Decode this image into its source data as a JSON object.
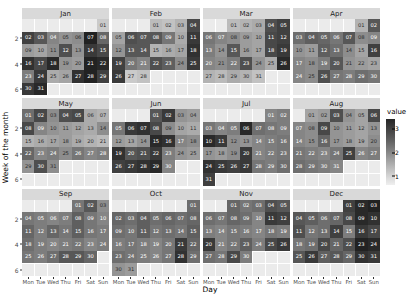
{
  "chart_data": {
    "type": "heatmap",
    "title": "",
    "xlabel": "Day",
    "ylabel": "Week of the month",
    "legend_title": "value",
    "legend_position": "right",
    "legend_ticks": [
      1,
      2,
      3
    ],
    "value_range": [
      0.6,
      3.4
    ],
    "color_low": "#f0f0f0",
    "color_high": "#1a1a1a",
    "panel_bg": "#ebebeb",
    "strip_bg": "#d9d9d9",
    "grid_color": "#ffffff",
    "x_categories": [
      "Mon",
      "Tue",
      "Wed",
      "Thu",
      "Fri",
      "Sat",
      "Sun"
    ],
    "y_ticks": [
      2,
      4,
      6
    ],
    "y_range": [
      1,
      6
    ],
    "facet_variable": "month",
    "facets": [
      {
        "label": "Jan",
        "start_weekday": 6,
        "days": 31,
        "values": [
          1.1,
          2.9,
          2.6,
          2.0,
          1.8,
          1.9,
          3.3,
          2.4,
          1.7,
          1.6,
          1.9,
          2.7,
          1.8,
          3.0,
          2.8,
          3.1,
          2.8,
          3.2,
          1.8,
          1.7,
          3.3,
          3.2,
          2.1,
          3.0,
          1.5,
          1.6,
          3.1,
          3.3,
          2.9,
          3.0,
          3.2
        ]
      },
      {
        "label": "Feb",
        "start_weekday": 3,
        "days": 28,
        "values": [
          1.3,
          1.2,
          1.4,
          2.8,
          1.6,
          2.7,
          2.6,
          2.6,
          2.2,
          1.5,
          3.0,
          1.8,
          2.6,
          2.6,
          1.4,
          1.5,
          1.6,
          3.1,
          2.9,
          2.2,
          2.0,
          2.7,
          2.5,
          1.9,
          3.0,
          3.0,
          1.1,
          1.2
        ]
      },
      {
        "label": "Mar",
        "start_weekday": 2,
        "days": 31,
        "values": [
          1.3,
          1.4,
          1.5,
          2.7,
          2.9,
          2.2,
          2.0,
          1.9,
          1.7,
          1.6,
          2.8,
          2.9,
          2.1,
          1.8,
          2.6,
          1.7,
          1.6,
          2.8,
          3.0,
          2.0,
          1.9,
          2.1,
          2.7,
          1.8,
          1.5,
          3.2,
          1.4,
          1.3,
          1.5,
          1.4,
          1.2
        ]
      },
      {
        "label": "Apr",
        "start_weekday": 5,
        "days": 30,
        "values": [
          1.4,
          2.6,
          2.3,
          2.5,
          2.4,
          2.2,
          2.6,
          1.9,
          2.0,
          1.8,
          1.7,
          2.5,
          2.3,
          1.9,
          1.6,
          2.9,
          2.0,
          1.9,
          2.1,
          2.6,
          1.8,
          1.7,
          1.6,
          2.0,
          1.9,
          2.7,
          2.2,
          2.1,
          2.3,
          2.2
        ]
      },
      {
        "label": "May",
        "start_weekday": 0,
        "days": 31,
        "values": [
          2.3,
          2.8,
          1.9,
          2.7,
          2.8,
          1.5,
          1.4,
          2.8,
          2.0,
          1.8,
          1.7,
          1.6,
          1.5,
          1.9,
          1.4,
          1.5,
          1.6,
          1.7,
          1.5,
          1.4,
          1.3,
          2.4,
          2.0,
          2.1,
          1.9,
          2.2,
          2.0,
          2.1,
          1.8,
          2.7,
          1.9
        ]
      },
      {
        "label": "Jun",
        "start_weekday": 3,
        "days": 30,
        "values": [
          2.6,
          3.0,
          1.8,
          1.7,
          2.2,
          3.0,
          3.1,
          2.8,
          1.9,
          1.6,
          1.5,
          1.7,
          1.6,
          1.8,
          3.2,
          3.1,
          2.0,
          1.9,
          3.1,
          2.6,
          2.7,
          3.0,
          2.1,
          1.8,
          1.7,
          2.9,
          3.0,
          3.1,
          3.2,
          2.0
        ]
      },
      {
        "label": "Jul",
        "start_weekday": 5,
        "days": 31,
        "values": [
          2.0,
          2.1,
          2.2,
          2.0,
          2.1,
          3.2,
          2.3,
          2.2,
          2.1,
          3.2,
          3.0,
          1.9,
          1.8,
          2.0,
          2.1,
          2.2,
          1.8,
          1.7,
          1.9,
          3.0,
          2.0,
          2.1,
          2.2,
          3.1,
          3.0,
          2.9,
          3.0,
          2.2,
          2.1,
          2.3,
          2.9
        ]
      },
      {
        "label": "Aug",
        "start_weekday": 1,
        "days": 31,
        "values": [
          1.6,
          1.7,
          2.7,
          1.8,
          1.6,
          2.8,
          2.0,
          1.9,
          2.8,
          1.8,
          1.7,
          1.6,
          1.8,
          2.0,
          1.9,
          2.4,
          1.8,
          1.7,
          1.6,
          1.9,
          2.2,
          2.1,
          2.0,
          2.2,
          2.9,
          2.0,
          2.1,
          2.3,
          2.2,
          2.1,
          2.0
        ]
      },
      {
        "label": "Sep",
        "start_weekday": 4,
        "days": 30,
        "values": [
          2.2,
          2.6,
          1.9,
          2.2,
          2.1,
          2.0,
          2.1,
          2.5,
          2.2,
          2.0,
          2.4,
          2.1,
          2.4,
          2.2,
          2.5,
          2.2,
          2.1,
          2.3,
          2.1,
          2.0,
          2.1,
          2.2,
          2.0,
          2.1,
          2.2,
          2.1,
          2.3,
          2.6,
          2.6,
          2.4
        ]
      },
      {
        "label": "Oct",
        "start_weekday": 6,
        "days": 31,
        "values": [
          2.3,
          2.4,
          2.3,
          2.5,
          2.3,
          2.4,
          2.3,
          2.4,
          2.3,
          2.2,
          2.5,
          2.2,
          2.3,
          2.2,
          2.5,
          2.1,
          2.2,
          2.1,
          2.0,
          2.2,
          3.0,
          2.4,
          2.3,
          2.2,
          2.1,
          2.0,
          2.2,
          3.1,
          2.3,
          1.8,
          1.7
        ]
      },
      {
        "label": "Nov",
        "start_weekday": 2,
        "days": 30,
        "values": [
          2.4,
          2.2,
          2.3,
          2.7,
          2.6,
          2.3,
          2.2,
          2.4,
          2.3,
          2.0,
          3.0,
          2.9,
          2.1,
          2.0,
          2.2,
          2.1,
          2.0,
          2.2,
          2.1,
          3.0,
          2.0,
          2.2,
          2.5,
          2.1,
          2.8,
          3.0,
          2.3,
          2.2,
          2.8,
          2.1
        ]
      },
      {
        "label": "Dec",
        "start_weekday": 4,
        "days": 31,
        "values": [
          2.9,
          3.2,
          3.3,
          2.6,
          2.5,
          2.3,
          2.4,
          2.8,
          3.2,
          3.1,
          2.7,
          2.2,
          2.3,
          2.9,
          2.1,
          3.0,
          2.8,
          2.2,
          2.3,
          2.8,
          2.4,
          2.7,
          3.3,
          3.2,
          2.6,
          3.0,
          2.5,
          2.6,
          2.4,
          3.1,
          3.0
        ]
      }
    ]
  }
}
